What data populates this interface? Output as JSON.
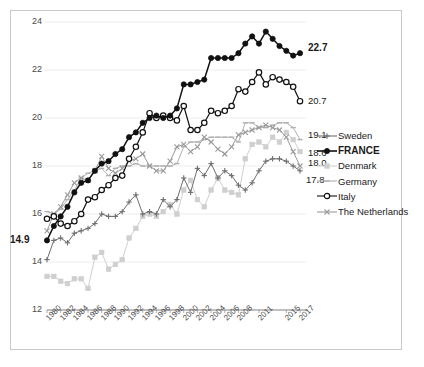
{
  "chart_data": {
    "type": "line",
    "title": "",
    "xlabel": "",
    "ylabel": "",
    "ylim": [
      12,
      24
    ],
    "yticks": [
      12,
      14,
      16,
      18,
      20,
      22,
      24
    ],
    "grid": true,
    "legend_position": "right",
    "categories": [
      "1980",
      "1981",
      "1982",
      "1983",
      "1984",
      "1985",
      "1986",
      "1987",
      "1988",
      "1989",
      "1990",
      "1991",
      "1992",
      "1993",
      "1994",
      "1995",
      "1996",
      "1997",
      "1998",
      "1999",
      "2000",
      "2001",
      "2002",
      "2003",
      "2004",
      "2005",
      "2006",
      "2007",
      "2008",
      "2009",
      "2010",
      "2011",
      "2012",
      "2013",
      "2014",
      "2015",
      "2016",
      "2017"
    ],
    "xtick_labels": [
      "1980",
      "1982",
      "1984",
      "1986",
      "1988",
      "1990",
      "1992",
      "1994",
      "1996",
      "1998",
      "2000",
      "2002",
      "2004",
      "2006",
      "2008",
      "2011",
      "2015",
      "2017"
    ],
    "series": [
      {
        "name": "Sweden",
        "color": "#6e6e6e",
        "marker": "plus",
        "end_value": "17.8",
        "values": [
          14.1,
          14.9,
          15.0,
          14.8,
          15.2,
          15.3,
          15.4,
          15.6,
          16.0,
          15.9,
          15.9,
          16.1,
          16.5,
          16.8,
          16.0,
          16.1,
          16.0,
          16.6,
          16.3,
          16.6,
          17.5,
          16.9,
          17.9,
          17.6,
          18.1,
          17.5,
          17.8,
          17.6,
          17.2,
          17.0,
          17.3,
          17.8,
          18.2,
          18.3,
          18.3,
          18.2,
          18.0,
          17.8
        ]
      },
      {
        "name": "FRANCE",
        "color": "#111111",
        "marker": "filled-circle",
        "start_value": "14.9",
        "end_value": "22.7",
        "values": [
          14.9,
          15.5,
          15.9,
          16.3,
          16.9,
          17.3,
          17.4,
          17.8,
          18.1,
          18.2,
          18.5,
          18.7,
          19.2,
          19.4,
          19.8,
          20.0,
          20.1,
          20.0,
          20.1,
          20.4,
          21.4,
          21.4,
          21.5,
          21.6,
          22.5,
          22.5,
          22.5,
          22.5,
          22.7,
          23.1,
          23.4,
          23.1,
          23.6,
          23.3,
          23.0,
          22.8,
          22.6,
          22.7
        ]
      },
      {
        "name": "Denmark",
        "color": "#cfcfcf",
        "marker": "filled-square",
        "end_value": "18.6",
        "values": [
          13.4,
          13.4,
          13.2,
          13.1,
          13.3,
          13.3,
          12.9,
          14.2,
          14.4,
          13.7,
          13.9,
          14.1,
          15.0,
          15.4,
          15.9,
          16.0,
          15.9,
          16.1,
          16.4,
          16.0,
          17.0,
          17.4,
          16.6,
          16.3,
          17.0,
          17.5,
          17.0,
          16.9,
          16.8,
          18.3,
          18.9,
          19.0,
          18.8,
          19.2,
          19.0,
          19.4,
          19.1,
          18.6
        ]
      },
      {
        "name": "Germany",
        "color": "#b0b0b0",
        "marker": "dash",
        "end_value": "19.1",
        "values": [
          16.1,
          16.0,
          16.2,
          16.6,
          17.0,
          17.5,
          17.7,
          17.8,
          17.9,
          17.6,
          17.9,
          18.0,
          18.0,
          18.1,
          18.0,
          18.0,
          18.0,
          18.0,
          18.0,
          18.1,
          18.8,
          19.0,
          19.0,
          19.1,
          19.2,
          19.2,
          19.2,
          19.2,
          19.0,
          19.8,
          19.8,
          19.6,
          19.6,
          19.7,
          19.8,
          19.8,
          19.6,
          19.1
        ]
      },
      {
        "name": "Italy",
        "color": "#111111",
        "marker": "open-circle",
        "end_value": "20.7",
        "values": [
          15.8,
          15.9,
          15.6,
          15.5,
          15.7,
          16.0,
          16.6,
          16.7,
          17.0,
          17.2,
          17.5,
          17.6,
          18.3,
          18.8,
          19.4,
          20.2,
          20.0,
          20.1,
          20.0,
          19.9,
          20.5,
          19.5,
          19.5,
          19.8,
          20.3,
          20.2,
          20.3,
          20.5,
          21.2,
          21.1,
          21.5,
          21.9,
          21.4,
          21.7,
          21.6,
          21.5,
          21.3,
          20.7
        ]
      },
      {
        "name": "The Netherlands",
        "color": "#9a9a9a",
        "marker": "x",
        "end_value": "18.0",
        "values": [
          15.3,
          16.0,
          16.3,
          16.8,
          17.3,
          17.5,
          17.4,
          17.8,
          18.4,
          17.9,
          17.7,
          17.9,
          18.2,
          18.3,
          18.5,
          18.0,
          17.8,
          17.8,
          18.2,
          18.8,
          18.9,
          18.6,
          18.8,
          19.2,
          19.0,
          18.7,
          18.5,
          18.8,
          19.3,
          19.4,
          19.5,
          19.6,
          19.7,
          19.6,
          19.5,
          19.2,
          18.6,
          18.0
        ]
      }
    ],
    "point_labels": [
      {
        "text": "22.7",
        "series": "FRANCE",
        "bold": true
      },
      {
        "text": "20.7",
        "series": "Italy",
        "bold": false
      },
      {
        "text": "19.1",
        "series": "Germany",
        "bold": false
      },
      {
        "text": "18.6",
        "series": "Denmark",
        "bold": false
      },
      {
        "text": "18",
        "series": "The Netherlands",
        "bold": false
      },
      {
        "text": "17.8",
        "series": "Sweden",
        "bold": false
      },
      {
        "text": "14.9",
        "series": "FRANCE",
        "bold": true
      }
    ]
  }
}
